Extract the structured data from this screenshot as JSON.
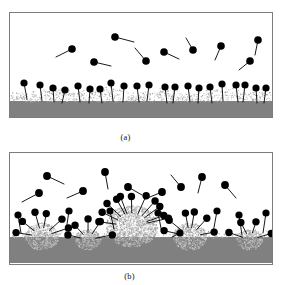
{
  "figure": {
    "title": "",
    "panels": [
      {
        "id": "a",
        "caption": "(a)",
        "description": "Low surfactant concentration: individual surfactant molecules adsorbed as a sparse monolayer of isolated head-and-tail molecules anchored in a thin granular surface layer, with free monomers dispersed in the solution above.",
        "substrate_color": "#808080",
        "granular_layer_color": "#c9c9c9",
        "molecule_color": "#000000"
      },
      {
        "id": "b",
        "caption": "(b)",
        "description": "High surfactant concentration: surfactant molecules assemble into hemimicellar surface aggregates on the substrate with molecules radiating outward, plus free monomers in the bulk solution.",
        "substrate_color": "#808080",
        "granular_layer_color": "#c9c9c9",
        "molecule_color": "#000000"
      }
    ],
    "colors": {
      "substrate": "#808080",
      "aggregate": "#c9c9c9",
      "molecule": "#000000",
      "frame": "#7c7c7c",
      "background": "#ffffff"
    }
  },
  "chart_data": {
    "type": "diagram",
    "panel_a": {
      "label": "(a)",
      "substrate_band": {
        "x": 0,
        "y": 88,
        "width": 262,
        "height": 17
      },
      "granular_layer": {
        "y_top": 76,
        "y_bottom": 89,
        "dot_count": 900
      },
      "adsorbed_molecules": [
        {
          "head_x": 14,
          "head_y": 70,
          "tail_x": 17,
          "tail_y": 86
        },
        {
          "head_x": 30,
          "head_y": 72,
          "tail_x": 32,
          "tail_y": 88
        },
        {
          "head_x": 43,
          "head_y": 75,
          "tail_x": 44,
          "tail_y": 89
        },
        {
          "head_x": 55,
          "head_y": 77,
          "tail_x": 52,
          "tail_y": 90
        },
        {
          "head_x": 68,
          "head_y": 73,
          "tail_x": 70,
          "tail_y": 89
        },
        {
          "head_x": 80,
          "head_y": 76,
          "tail_x": 79,
          "tail_y": 90
        },
        {
          "head_x": 90,
          "head_y": 76,
          "tail_x": 92,
          "tail_y": 90
        },
        {
          "head_x": 101,
          "head_y": 70,
          "tail_x": 103,
          "tail_y": 88
        },
        {
          "head_x": 114,
          "head_y": 73,
          "tail_x": 113,
          "tail_y": 89
        },
        {
          "head_x": 127,
          "head_y": 73,
          "tail_x": 129,
          "tail_y": 89
        },
        {
          "head_x": 139,
          "head_y": 72,
          "tail_x": 137,
          "tail_y": 88
        },
        {
          "head_x": 155,
          "head_y": 74,
          "tail_x": 157,
          "tail_y": 90
        },
        {
          "head_x": 165,
          "head_y": 74,
          "tail_x": 163,
          "tail_y": 90
        },
        {
          "head_x": 178,
          "head_y": 73,
          "tail_x": 180,
          "tail_y": 89
        },
        {
          "head_x": 189,
          "head_y": 75,
          "tail_x": 188,
          "tail_y": 90
        },
        {
          "head_x": 200,
          "head_y": 74,
          "tail_x": 202,
          "tail_y": 90
        },
        {
          "head_x": 212,
          "head_y": 71,
          "tail_x": 213,
          "tail_y": 88
        },
        {
          "head_x": 226,
          "head_y": 72,
          "tail_x": 228,
          "tail_y": 89
        },
        {
          "head_x": 235,
          "head_y": 72,
          "tail_x": 233,
          "tail_y": 89
        },
        {
          "head_x": 246,
          "head_y": 75,
          "tail_x": 247,
          "tail_y": 90
        },
        {
          "head_x": 256,
          "head_y": 75,
          "tail_x": 254,
          "tail_y": 90
        }
      ],
      "free_molecules": [
        {
          "head_x": 62,
          "head_y": 36,
          "tail_x": 46,
          "tail_y": 44
        },
        {
          "head_x": 105,
          "head_y": 24,
          "tail_x": 124,
          "tail_y": 29
        },
        {
          "head_x": 84,
          "head_y": 49,
          "tail_x": 101,
          "tail_y": 53
        },
        {
          "head_x": 136,
          "head_y": 48,
          "tail_x": 125,
          "tail_y": 35
        },
        {
          "head_x": 154,
          "head_y": 39,
          "tail_x": 169,
          "tail_y": 46
        },
        {
          "head_x": 183,
          "head_y": 37,
          "tail_x": 176,
          "tail_y": 25
        },
        {
          "head_x": 211,
          "head_y": 33,
          "tail_x": 205,
          "tail_y": 47
        },
        {
          "head_x": 248,
          "head_y": 27,
          "tail_x": 245,
          "tail_y": 42
        },
        {
          "head_x": 240,
          "head_y": 48,
          "tail_x": 229,
          "tail_y": 57
        }
      ]
    },
    "panel_b": {
      "label": "(b)",
      "substrate_band": {
        "x": 0,
        "y": 84,
        "width": 262,
        "height": 26
      },
      "aggregates": [
        {
          "center_x": 32,
          "center_y": 88,
          "radius": 17
        },
        {
          "center_x": 78,
          "center_y": 90,
          "radius": 13
        },
        {
          "center_x": 122,
          "center_y": 80,
          "radius": 26
        },
        {
          "center_x": 180,
          "center_y": 88,
          "radius": 17
        },
        {
          "center_x": 240,
          "center_y": 90,
          "radius": 13
        }
      ],
      "aggregate_molecules": 34,
      "free_molecules": [
        {
          "head_x": 37,
          "head_y": 23,
          "tail_x": 54,
          "tail_y": 31
        },
        {
          "head_x": 29,
          "head_y": 40,
          "tail_x": 12,
          "tail_y": 49
        },
        {
          "head_x": 73,
          "head_y": 38,
          "tail_x": 57,
          "tail_y": 45
        },
        {
          "head_x": 95,
          "head_y": 19,
          "tail_x": 98,
          "tail_y": 36
        },
        {
          "head_x": 118,
          "head_y": 34,
          "tail_x": 132,
          "tail_y": 42
        },
        {
          "head_x": 152,
          "head_y": 39,
          "tail_x": 135,
          "tail_y": 46
        },
        {
          "head_x": 171,
          "head_y": 34,
          "tail_x": 161,
          "tail_y": 22
        },
        {
          "head_x": 192,
          "head_y": 24,
          "tail_x": 188,
          "tail_y": 40
        },
        {
          "head_x": 215,
          "head_y": 32,
          "tail_x": 226,
          "tail_y": 45
        }
      ]
    }
  }
}
